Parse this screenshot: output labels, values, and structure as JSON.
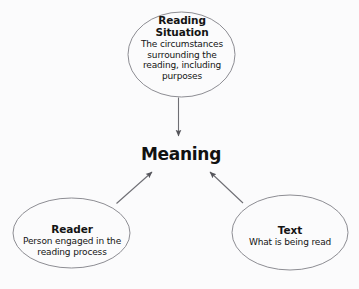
{
  "diagram": {
    "title": "Meaning",
    "center": {
      "label": "Meaning"
    },
    "nodes": [
      {
        "id": "reading-situation",
        "title_line1": "Reading",
        "title_line2": "Situation",
        "body_line1": "The circumstances",
        "body_line2": "surrounding the",
        "body_line3": "reading, including",
        "body_line4": "purposes"
      },
      {
        "id": "reader",
        "title_line1": "Reader",
        "body_line1": "Person engaged in the",
        "body_line2": "reading process"
      },
      {
        "id": "text",
        "title_line1": "Text",
        "body_line1": "What is being read"
      }
    ],
    "colors": {
      "background": "#fbfbfc",
      "ellipse_stroke": "#8d8d93",
      "arrow": "#6e6e74",
      "text": "#141414"
    }
  }
}
